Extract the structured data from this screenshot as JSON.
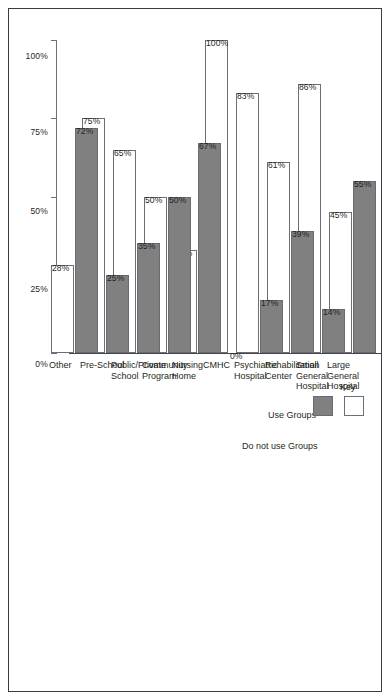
{
  "chart_data": {
    "type": "bar",
    "orientation": "horizontal",
    "title": "",
    "xlabel": "",
    "ylabel": "",
    "xlim": [
      0,
      100
    ],
    "grid": false,
    "tick_labels": [
      "0%",
      "25%",
      "50%",
      "75%",
      "100%"
    ],
    "tick_values": [
      0,
      25,
      50,
      75,
      100
    ],
    "legend_position": "upper-left",
    "categories": [
      "Large General Hospital",
      "Small General Hospital",
      "Rehabilitation Center",
      "Psychiatric Hospital",
      "CMHC",
      "Nursing Home",
      "Community Program",
      "Public/Private School",
      "Pre-School",
      "Other"
    ],
    "category_lines": [
      [
        "Large",
        "General",
        "Hospital"
      ],
      [
        "Small",
        "General",
        "Hospital"
      ],
      [
        "Rehabilitation",
        "Center"
      ],
      [
        "Psychiatric",
        "Hospital"
      ],
      [
        "CMHC"
      ],
      [
        "Nursing",
        "Home"
      ],
      [
        "Community",
        "Program"
      ],
      [
        "Public/Private",
        "School"
      ],
      [
        "Pre-School"
      ],
      [
        "Other"
      ]
    ],
    "series": [
      {
        "name": "Use Groups",
        "color": "#ffffff",
        "values": [
          45,
          86,
          61,
          83,
          100,
          33,
          50,
          65,
          75,
          28
        ],
        "labels": [
          "45%",
          "86%",
          "61%",
          "83%",
          "100%",
          "33%",
          "50%",
          "65%",
          "75%",
          "28%"
        ]
      },
      {
        "name": "Do not use Groups",
        "color": "#808080",
        "values": [
          55,
          14,
          39,
          17,
          0,
          67,
          50,
          35,
          25,
          72
        ],
        "labels": [
          "55%",
          "14%",
          "39%",
          "17%",
          "0%",
          "67%",
          "50%",
          "35%",
          "25%",
          "72%"
        ]
      }
    ]
  },
  "legend": {
    "title": "Key",
    "entries": [
      {
        "label": "Use Groups",
        "swatch": "white-swatch"
      },
      {
        "label": "Do not use Groups",
        "swatch": "gray-swatch"
      }
    ]
  },
  "colors": {
    "bar_use": "#ffffff",
    "bar_nouse": "#808080",
    "axis": "#6f6f78",
    "text": "#1f1f24",
    "frame": "#3a3a46"
  }
}
